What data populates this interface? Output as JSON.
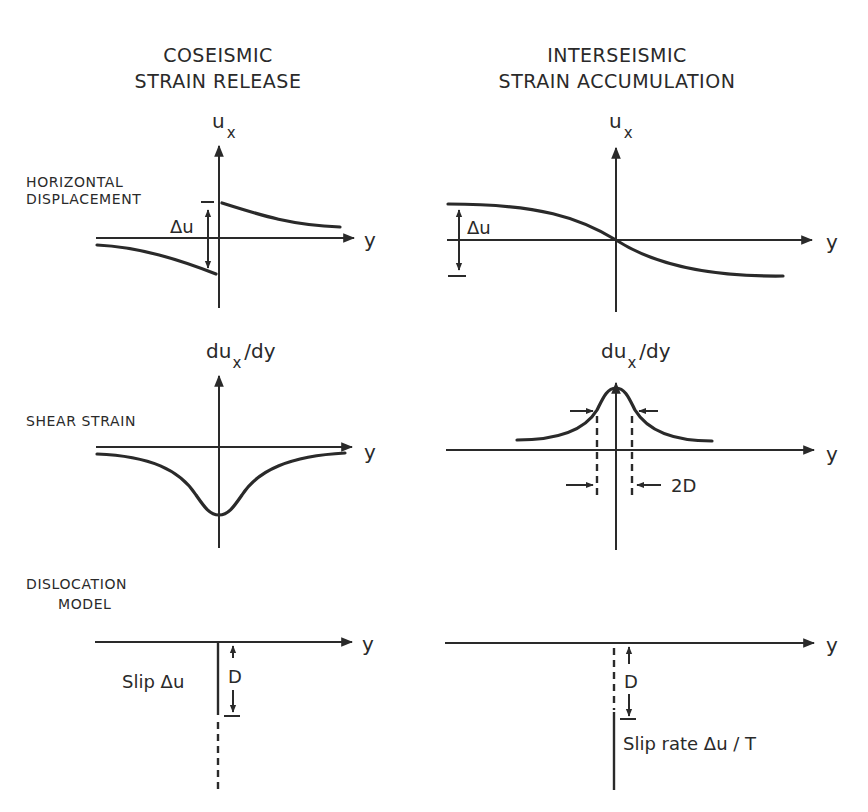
{
  "columns": {
    "left": {
      "line1": "COSEISMIC",
      "line2": "STRAIN RELEASE"
    },
    "right": {
      "line1": "INTERSEISMIC",
      "line2": "STRAIN ACCUMULATION"
    }
  },
  "rows": {
    "displacement": {
      "line1": "HORIZONTAL",
      "line2": "DISPLACEMENT"
    },
    "strain": {
      "label": "SHEAR STRAIN"
    },
    "model": {
      "line1": "DISLOCATION",
      "line2": "MODEL"
    }
  },
  "axes": {
    "ux_main": "u",
    "ux_sub": "x",
    "dux_main": "du",
    "dux_sub": "x",
    "dux_tail": "/dy",
    "y": "y"
  },
  "annotations": {
    "delta_u": "Δu",
    "two_d": "2D",
    "d": "D",
    "slip": "Slip  Δu",
    "slip_rate": "Slip rate  Δu / T"
  }
}
